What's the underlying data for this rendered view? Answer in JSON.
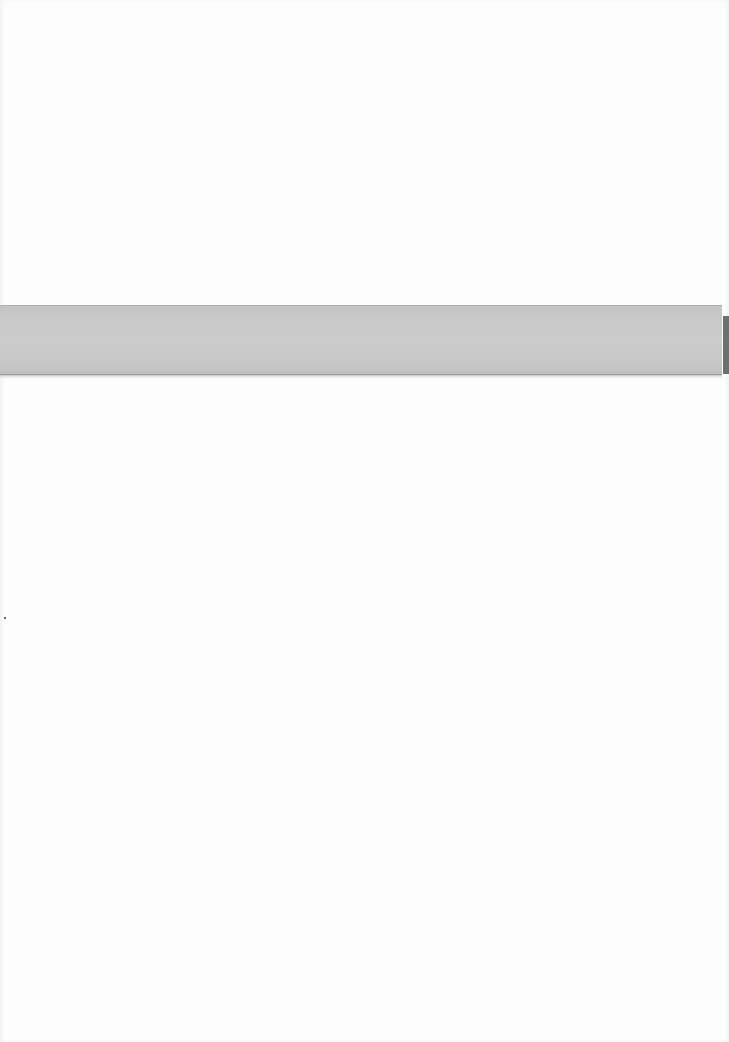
{
  "page": {
    "type": "scanned-blank-page",
    "background_color": "#fdfdfd"
  },
  "band": {
    "color": "#c9c9c9",
    "text": ""
  }
}
